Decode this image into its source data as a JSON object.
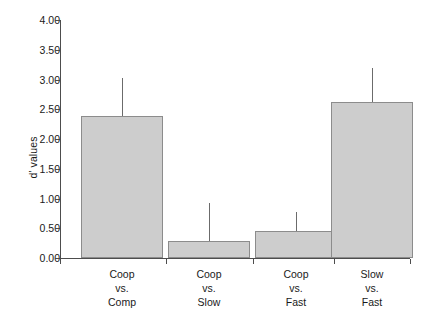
{
  "chart_data": {
    "type": "bar",
    "title": "",
    "xlabel": "",
    "ylabel": "d' values",
    "categories": [
      "Coop\nvs.\nComp",
      "Coop\nvs.\nSlow",
      "Coop\nvs.\nFast",
      "Slow\nvs.\nFast"
    ],
    "category_lines": [
      [
        "Coop",
        "vs.",
        "Comp"
      ],
      [
        "Coop",
        "vs.",
        "Slow"
      ],
      [
        "Coop",
        "vs.",
        "Fast"
      ],
      [
        "Slow",
        "vs.",
        "Fast"
      ]
    ],
    "values": [
      2.39,
      0.29,
      0.45,
      2.62
    ],
    "error_upper": [
      3.03,
      0.93,
      0.78,
      3.2
    ],
    "errors": [
      0.64,
      0.64,
      0.33,
      0.58
    ],
    "ylim": [
      0.0,
      4.0
    ],
    "ytick_values": [
      0.0,
      0.5,
      1.0,
      1.5,
      2.0,
      2.5,
      3.0,
      3.5,
      4.0
    ],
    "ytick_labels": [
      "0.00",
      "0.50",
      "1.00",
      "1.50",
      "2.00",
      "2.50",
      "3.00",
      "3.50",
      "4.00"
    ],
    "grid": false,
    "legend": "none",
    "bar_color": "#cdcdcd",
    "bar_edge_color": "#8c8c8c",
    "axis_color": "#4d4d4d",
    "error_color": "#6b6b6b",
    "background": "#ffffff"
  },
  "layout": {
    "plot_left": 60,
    "plot_right": 410,
    "plot_bottom": 258,
    "plot_top": 20,
    "bar_width": 82,
    "bar_centers": [
      122,
      209,
      296,
      372
    ]
  }
}
